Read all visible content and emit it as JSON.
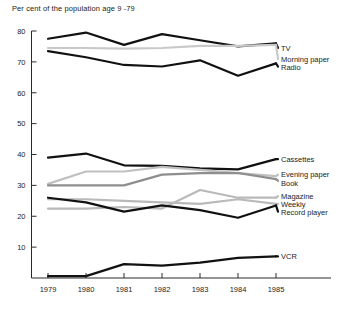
{
  "chart_data": {
    "type": "line",
    "title": "Per cent of the population age 9 -79",
    "xlabel": "",
    "ylabel": "",
    "x": [
      1979,
      1980,
      1981,
      1982,
      1983,
      1984,
      1985
    ],
    "categories": [
      "1979",
      "1980",
      "1981",
      "1982",
      "1983",
      "1984",
      "1985"
    ],
    "ylim": [
      0,
      80
    ],
    "yticks": [
      10,
      20,
      30,
      40,
      50,
      60,
      70,
      80
    ],
    "ytick_labels": [
      "10",
      "20",
      "30",
      "40",
      "50",
      "60",
      "70",
      "80"
    ],
    "grid": false,
    "legend_position": "right-inline",
    "series": [
      {
        "name": "TV",
        "values": [
          77.5,
          79.5,
          75.5,
          79.0,
          77.0,
          75.0,
          76.0
        ],
        "color": "#111111",
        "width": 2.2,
        "label_y": 74.5
      },
      {
        "name": "Morning paper",
        "values": [
          74.5,
          74.5,
          74.3,
          74.5,
          75.2,
          75.2,
          75.5
        ],
        "color": "#c9c9c9",
        "width": 2.2,
        "label_y": 71.0
      },
      {
        "name": "Radio",
        "values": [
          73.5,
          71.5,
          69.0,
          68.5,
          70.5,
          65.5,
          69.5
        ],
        "color": "#111111",
        "width": 2.2,
        "label_y": 68.5
      },
      {
        "name": "Cassettes",
        "values": [
          39.0,
          40.3,
          36.5,
          36.3,
          35.5,
          35.2,
          38.5
        ],
        "color": "#111111",
        "width": 2.2,
        "label_y": 38.5
      },
      {
        "name": "Evening paper",
        "values": [
          30.5,
          34.5,
          34.5,
          36.0,
          35.0,
          34.0,
          33.0
        ],
        "color": "#c0c0c0",
        "width": 2.2,
        "label_y": 33.5
      },
      {
        "name": "Book",
        "values": [
          30.0,
          30.0,
          30.0,
          33.5,
          34.0,
          34.0,
          32.0
        ],
        "color": "#8e8e8e",
        "width": 2.2,
        "label_y": 31.5
      },
      {
        "name": "Magazine",
        "values": [
          22.5,
          22.5,
          23.0,
          22.5,
          28.5,
          26.0,
          26.0
        ],
        "color": "#b9b9b9",
        "width": 2.2,
        "label_y": 26.5
      },
      {
        "name": "Weekly",
        "values": [
          25.5,
          25.5,
          25.0,
          24.5,
          24.0,
          25.5,
          24.0
        ],
        "color": "#b9b9b9",
        "width": 2.2,
        "label_y": 24.0
      },
      {
        "name": "Record player",
        "values": [
          26.0,
          24.5,
          21.5,
          23.5,
          22.0,
          19.5,
          23.5
        ],
        "color": "#111111",
        "width": 2.2,
        "label_y": 21.5
      },
      {
        "name": "VCR",
        "values": [
          0.6,
          0.6,
          4.5,
          4.0,
          5.0,
          6.5,
          7.0
        ],
        "color": "#111111",
        "width": 2.2,
        "label_y": 7.0
      }
    ]
  }
}
